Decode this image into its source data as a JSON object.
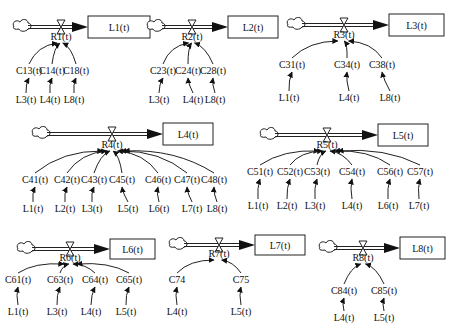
{
  "diagram": {
    "type": "stock-flow",
    "modules": [
      {
        "id": "1",
        "stock": "L1(t)",
        "rate": "R1(t)",
        "converters": [
          "C13(t)",
          "C14(t)",
          "C18(t)"
        ],
        "inputs": [
          "L3(t)",
          "L4(t)",
          "L8(t)"
        ]
      },
      {
        "id": "2",
        "stock": "L2(t)",
        "rate": "R2(t)",
        "converters": [
          "C23(t)",
          "C24(t)",
          "C28(t)"
        ],
        "inputs": [
          "L3(t)",
          "L4(t)",
          "L8(t)"
        ]
      },
      {
        "id": "3",
        "stock": "L3(t)",
        "rate": "R3(t)",
        "converters": [
          "C31(t)",
          "C34(t)",
          "C38(t)"
        ],
        "inputs": [
          "L1(t)",
          "L4(t)",
          "L8(t)"
        ]
      },
      {
        "id": "4",
        "stock": "L4(t)",
        "rate": "R4(t)",
        "converters": [
          "C41(t)",
          "C42(t)",
          "C43(t)",
          "C45(t)",
          "C46(t)",
          "C47(t)",
          "C48(t)"
        ],
        "inputs": [
          "L1(t)",
          "L2(t)",
          "L3(t)",
          "L5(t)",
          "L6(t)",
          "L7(t)",
          "L8(t)"
        ]
      },
      {
        "id": "5",
        "stock": "L5(t)",
        "rate": "R5(t)",
        "converters": [
          "C51(t)",
          "C52(t)",
          "C53(t)",
          "C54(t)",
          "C56(t)",
          "C57(t)"
        ],
        "inputs": [
          "L1(t)",
          "L2(t)",
          "L3(t)",
          "L4(t)",
          "L6(t)",
          "L7(t)"
        ]
      },
      {
        "id": "6",
        "stock": "L6(t)",
        "rate": "R6(t)",
        "converters": [
          "C61(t)",
          "C63(t)",
          "C64(t)",
          "C65(t)"
        ],
        "inputs": [
          "L1(t)",
          "L3(t)",
          "L4(t)",
          "L5(t)"
        ]
      },
      {
        "id": "7",
        "stock": "L7(t)",
        "rate": "R7(t)",
        "converters": [
          "C74",
          "C75"
        ],
        "inputs": [
          "L4(t)",
          "L5(t)"
        ]
      },
      {
        "id": "8",
        "stock": "L8(t)",
        "rate": "R8(t)",
        "converters": [
          "C84(t)",
          "C85(t)"
        ],
        "inputs": [
          "L4(t)",
          "L5(t)"
        ]
      }
    ]
  },
  "icons": {
    "source": "cloud-icon",
    "valve": "hourglass-valve-icon",
    "stock": "rectangle-stock"
  },
  "colors": {
    "ink": "#222222",
    "background": "#ffffff"
  }
}
